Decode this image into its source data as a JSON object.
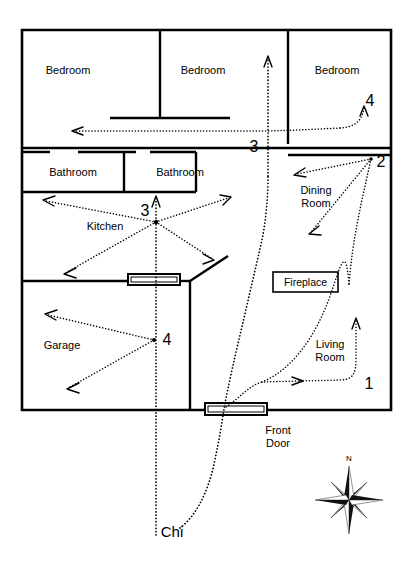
{
  "diagram": {
    "chi_label": "Chi",
    "front_door_label": "Front\nDoor",
    "front_door_line1": "Front",
    "front_door_line2": "Door",
    "fireplace_label": "Fireplace",
    "compass_north": "N"
  },
  "rooms": [
    {
      "id": "bedroom-1",
      "label": "Bedroom"
    },
    {
      "id": "bedroom-2",
      "label": "Bedroom"
    },
    {
      "id": "bedroom-3",
      "label": "Bedroom"
    },
    {
      "id": "bathroom-1",
      "label": "Bathroom"
    },
    {
      "id": "bathroom-2",
      "label": "Bathroom"
    },
    {
      "id": "kitchen",
      "label": "Kitchen"
    },
    {
      "id": "garage",
      "label": "Garage"
    },
    {
      "id": "dining-room-line1",
      "label": "Dining"
    },
    {
      "id": "dining-room-line2",
      "label": "Room"
    },
    {
      "id": "living-room-line1",
      "label": "Living"
    },
    {
      "id": "living-room-line2",
      "label": "Room"
    }
  ],
  "chi_nodes": [
    {
      "id": "node-1",
      "label": "1",
      "location": "living-room"
    },
    {
      "id": "node-2",
      "label": "2",
      "location": "dining-room"
    },
    {
      "id": "node-3-hall",
      "label": "3",
      "location": "hallway"
    },
    {
      "id": "node-3-kitchen",
      "label": "3",
      "location": "kitchen"
    },
    {
      "id": "node-4-bedroom",
      "label": "4",
      "location": "bedroom-3"
    },
    {
      "id": "node-4-garage",
      "label": "4",
      "location": "garage"
    }
  ],
  "colors": {
    "stroke": "#000000",
    "background": "#ffffff",
    "compass_dark": "#111111"
  }
}
